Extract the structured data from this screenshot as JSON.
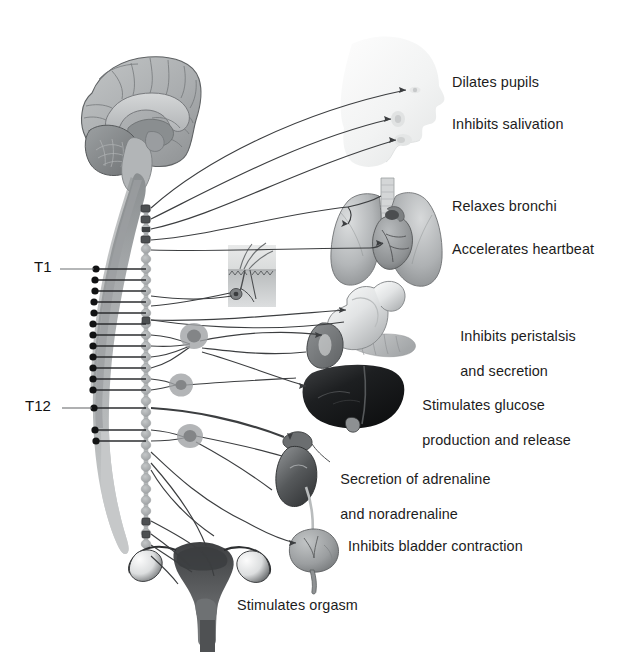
{
  "diagram": {
    "type": "anatomical-schematic",
    "colors": {
      "background": "#ffffff",
      "text": "#1c1c1c",
      "nerve_line": "#3a3a3a",
      "spinal_cord_light": "#b9bcbd",
      "spinal_cord_dark": "#8e9294",
      "ganglion_chain": "#bfc2c3",
      "ganglion_node": "#9a9d9f",
      "brain_light": "#b6b9ba",
      "brain_mid": "#9b9fa1",
      "brain_dark": "#77797b",
      "organ_light": "#d2d4d5",
      "organ_mid": "#a3a6a8",
      "organ_dark": "#6e7173",
      "liver": "#1d1e1f",
      "uterus": "#4c4e50",
      "head_silhouette": "#f0f1f1"
    }
  },
  "spine_labels": [
    {
      "id": "t1",
      "text": "T1",
      "x": 34,
      "y": 258,
      "leader_to_x": 95,
      "leader_y": 269
    },
    {
      "id": "t12",
      "text": "T12",
      "x": 25,
      "y": 397,
      "leader_to_x": 95,
      "leader_y": 408
    }
  ],
  "organ_labels": [
    {
      "id": "pupils",
      "lines": [
        "Dilates pupils"
      ],
      "x": 452,
      "y": 74,
      "align": "left"
    },
    {
      "id": "salivation",
      "lines": [
        "Inhibits salivation"
      ],
      "x": 452,
      "y": 116,
      "align": "left"
    },
    {
      "id": "bronchi",
      "lines": [
        "Relaxes bronchi"
      ],
      "x": 452,
      "y": 198,
      "align": "left"
    },
    {
      "id": "heartbeat",
      "lines": [
        "Accelerates heartbeat"
      ],
      "x": 452,
      "y": 241,
      "align": "left"
    },
    {
      "id": "peristalsis",
      "lines": [
        "Inhibits peristalsis",
        "and secretion"
      ],
      "x": 452,
      "y": 310,
      "align": "left"
    },
    {
      "id": "glucose",
      "lines": [
        "Stimulates glucose",
        "production and release"
      ],
      "x": 414,
      "y": 379,
      "align": "left"
    },
    {
      "id": "adrenaline",
      "lines": [
        "Secretion of adrenaline",
        "and noradrenaline"
      ],
      "x": 332,
      "y": 453,
      "align": "left"
    },
    {
      "id": "bladder",
      "lines": [
        "Inhibits bladder contraction"
      ],
      "x": 348,
      "y": 538,
      "align": "left"
    },
    {
      "id": "orgasm",
      "lines": [
        "Stimulates orgasm"
      ],
      "x": 237,
      "y": 597,
      "align": "left"
    }
  ],
  "organs": [
    {
      "id": "brain",
      "name": "brain-sagittal-section"
    },
    {
      "id": "head",
      "name": "head-profile-silhouette"
    },
    {
      "id": "lungs",
      "name": "lungs-and-heart"
    },
    {
      "id": "skin",
      "name": "skin-hair-follicle-inset"
    },
    {
      "id": "stomach",
      "name": "stomach-duodenum-pancreas"
    },
    {
      "id": "liver",
      "name": "liver"
    },
    {
      "id": "kidney",
      "name": "kidney-with-adrenal-gland"
    },
    {
      "id": "bladder",
      "name": "urinary-bladder"
    },
    {
      "id": "uterus",
      "name": "uterus-and-ovaries"
    },
    {
      "id": "cord",
      "name": "spinal-cord"
    },
    {
      "id": "chain",
      "name": "sympathetic-ganglion-chain"
    }
  ]
}
